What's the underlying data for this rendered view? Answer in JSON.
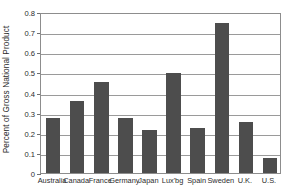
{
  "chart_data": {
    "type": "bar",
    "title": "",
    "subtitle": "",
    "xlabel": "",
    "ylabel": "Percent of Gross National Product",
    "categories": [
      "Australia",
      "Canada",
      "France",
      "Germany",
      "Japan",
      "Lux'bg",
      "Spain",
      "Sweden",
      "U.K.",
      "U.S."
    ],
    "values": [
      0.275,
      0.36,
      0.45,
      0.275,
      0.215,
      0.495,
      0.225,
      0.745,
      0.255,
      0.075
    ],
    "series": [
      {
        "name": "Foreign aid as percent of GNP",
        "values": [
          0.275,
          0.36,
          0.45,
          0.275,
          0.215,
          0.495,
          0.225,
          0.745,
          0.255,
          0.075
        ]
      }
    ],
    "ylim": [
      0,
      0.8
    ],
    "ytick_labels": [
      "0.8",
      "0.7",
      "0.6",
      "0.5",
      "0.4",
      "0.3",
      "0.2",
      "0.1",
      "0"
    ],
    "ytick_values": [
      0.8,
      0.7,
      0.6,
      0.5,
      0.4,
      0.3,
      0.2,
      0.1,
      0
    ],
    "grid": true,
    "grid_axis": "y",
    "legend": false,
    "legend_position": "none",
    "bar_color": "#4d4d4d",
    "frame_color": "#8d8d8d",
    "gridline_color": "#9a9a9a",
    "background_color": "#ffffff",
    "annotations": []
  }
}
